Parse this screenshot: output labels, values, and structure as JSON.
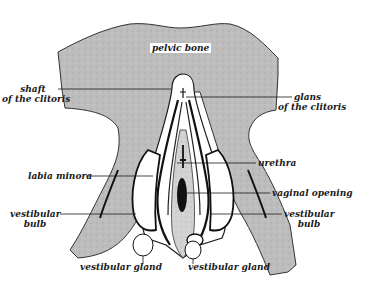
{
  "diagram": {
    "colors": {
      "bone_fill": "#b9b9b9",
      "outline": "#1a1a1a",
      "tissue_fill": "#ffffff",
      "inner_fill": "#cfcfcf",
      "opening_fill": "#111111"
    },
    "labels": {
      "pelvic_bone": "pelvic bone",
      "shaft_line1": "shaft",
      "shaft_line2": "of the clitoris",
      "glans_line1": "glans",
      "glans_line2": "of the clitoris",
      "labia_minora": "labia minora",
      "urethra": "urethra",
      "vaginal_opening": "vaginal opening",
      "vestibular_bulb_left_line1": "vestibular",
      "vestibular_bulb_left_line2": "bulb",
      "vestibular_bulb_right_line1": "vestibular",
      "vestibular_bulb_right_line2": "bulb",
      "vestibular_gland_left": "vestibular gland",
      "vestibular_gland_right": "vestibular gland"
    }
  }
}
